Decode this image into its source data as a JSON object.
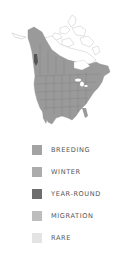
{
  "map": {
    "region": "North America range map",
    "colors": {
      "breeding_fill": "#9a9a9a",
      "yearround_fill": "#555555",
      "land_outline": "#c8c8c8",
      "border_lines": "#7d7d7d"
    }
  },
  "legend": {
    "items": [
      {
        "label": "BREEDING",
        "color": "#a3a3a3"
      },
      {
        "label": "WINTER",
        "color": "#acacac"
      },
      {
        "label": "YEAR-ROUND",
        "color": "#6e6e6e"
      },
      {
        "label": "MIGRATION",
        "color": "#bdbdbd"
      },
      {
        "label": "RARE",
        "color": "#e4e4e4"
      }
    ]
  }
}
